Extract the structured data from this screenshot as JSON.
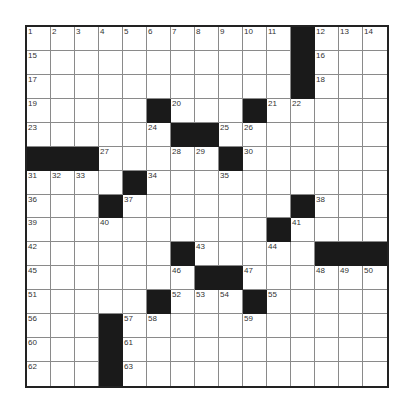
{
  "puzzle": {
    "rows": 15,
    "cols": 15,
    "colors": {
      "block": "#1a1a1a",
      "cell": "#ffffff",
      "line": "#8a8a8a",
      "border": "#222222"
    },
    "blocks": [
      [
        0,
        11
      ],
      [
        1,
        11
      ],
      [
        2,
        11
      ],
      [
        3,
        5
      ],
      [
        3,
        9
      ],
      [
        4,
        6
      ],
      [
        4,
        7
      ],
      [
        5,
        0
      ],
      [
        5,
        1
      ],
      [
        5,
        2
      ],
      [
        5,
        8
      ],
      [
        6,
        4
      ],
      [
        7,
        3
      ],
      [
        7,
        11
      ],
      [
        8,
        10
      ],
      [
        9,
        6
      ],
      [
        9,
        12
      ],
      [
        9,
        13
      ],
      [
        9,
        14
      ],
      [
        10,
        7
      ],
      [
        10,
        8
      ],
      [
        11,
        5
      ],
      [
        11,
        9
      ],
      [
        12,
        3
      ],
      [
        13,
        3
      ],
      [
        14,
        3
      ]
    ],
    "numbers": [
      {
        "r": 0,
        "c": 0,
        "n": "1"
      },
      {
        "r": 0,
        "c": 1,
        "n": "2"
      },
      {
        "r": 0,
        "c": 2,
        "n": "3"
      },
      {
        "r": 0,
        "c": 3,
        "n": "4"
      },
      {
        "r": 0,
        "c": 4,
        "n": "5"
      },
      {
        "r": 0,
        "c": 5,
        "n": "6"
      },
      {
        "r": 0,
        "c": 6,
        "n": "7"
      },
      {
        "r": 0,
        "c": 7,
        "n": "8"
      },
      {
        "r": 0,
        "c": 8,
        "n": "9"
      },
      {
        "r": 0,
        "c": 9,
        "n": "10"
      },
      {
        "r": 0,
        "c": 10,
        "n": "11"
      },
      {
        "r": 0,
        "c": 12,
        "n": "12"
      },
      {
        "r": 0,
        "c": 13,
        "n": "13"
      },
      {
        "r": 0,
        "c": 14,
        "n": "14"
      },
      {
        "r": 1,
        "c": 0,
        "n": "15"
      },
      {
        "r": 1,
        "c": 12,
        "n": "16"
      },
      {
        "r": 2,
        "c": 0,
        "n": "17"
      },
      {
        "r": 2,
        "c": 12,
        "n": "18"
      },
      {
        "r": 3,
        "c": 0,
        "n": "19"
      },
      {
        "r": 3,
        "c": 6,
        "n": "20"
      },
      {
        "r": 3,
        "c": 10,
        "n": "21"
      },
      {
        "r": 3,
        "c": 11,
        "n": "22"
      },
      {
        "r": 4,
        "c": 0,
        "n": "23"
      },
      {
        "r": 4,
        "c": 5,
        "n": "24"
      },
      {
        "r": 4,
        "c": 8,
        "n": "25"
      },
      {
        "r": 4,
        "c": 9,
        "n": "26"
      },
      {
        "r": 5,
        "c": 3,
        "n": "27"
      },
      {
        "r": 5,
        "c": 6,
        "n": "28"
      },
      {
        "r": 5,
        "c": 7,
        "n": "29"
      },
      {
        "r": 5,
        "c": 9,
        "n": "30"
      },
      {
        "r": 6,
        "c": 0,
        "n": "31"
      },
      {
        "r": 6,
        "c": 1,
        "n": "32"
      },
      {
        "r": 6,
        "c": 2,
        "n": "33"
      },
      {
        "r": 6,
        "c": 5,
        "n": "34"
      },
      {
        "r": 6,
        "c": 8,
        "n": "35"
      },
      {
        "r": 7,
        "c": 0,
        "n": "36"
      },
      {
        "r": 7,
        "c": 4,
        "n": "37"
      },
      {
        "r": 7,
        "c": 12,
        "n": "38"
      },
      {
        "r": 8,
        "c": 0,
        "n": "39"
      },
      {
        "r": 8,
        "c": 3,
        "n": "40"
      },
      {
        "r": 8,
        "c": 11,
        "n": "41"
      },
      {
        "r": 9,
        "c": 0,
        "n": "42"
      },
      {
        "r": 9,
        "c": 7,
        "n": "43"
      },
      {
        "r": 9,
        "c": 10,
        "n": "44"
      },
      {
        "r": 10,
        "c": 0,
        "n": "45"
      },
      {
        "r": 10,
        "c": 6,
        "n": "46"
      },
      {
        "r": 10,
        "c": 9,
        "n": "47"
      },
      {
        "r": 10,
        "c": 12,
        "n": "48"
      },
      {
        "r": 10,
        "c": 13,
        "n": "49"
      },
      {
        "r": 10,
        "c": 14,
        "n": "50"
      },
      {
        "r": 11,
        "c": 0,
        "n": "51"
      },
      {
        "r": 11,
        "c": 6,
        "n": "52"
      },
      {
        "r": 11,
        "c": 7,
        "n": "53"
      },
      {
        "r": 11,
        "c": 8,
        "n": "54"
      },
      {
        "r": 11,
        "c": 10,
        "n": "55"
      },
      {
        "r": 12,
        "c": 0,
        "n": "56"
      },
      {
        "r": 12,
        "c": 4,
        "n": "57"
      },
      {
        "r": 12,
        "c": 5,
        "n": "58"
      },
      {
        "r": 12,
        "c": 9,
        "n": "59"
      },
      {
        "r": 13,
        "c": 0,
        "n": "60"
      },
      {
        "r": 13,
        "c": 4,
        "n": "61"
      },
      {
        "r": 14,
        "c": 0,
        "n": "62"
      },
      {
        "r": 14,
        "c": 4,
        "n": "63"
      }
    ]
  }
}
